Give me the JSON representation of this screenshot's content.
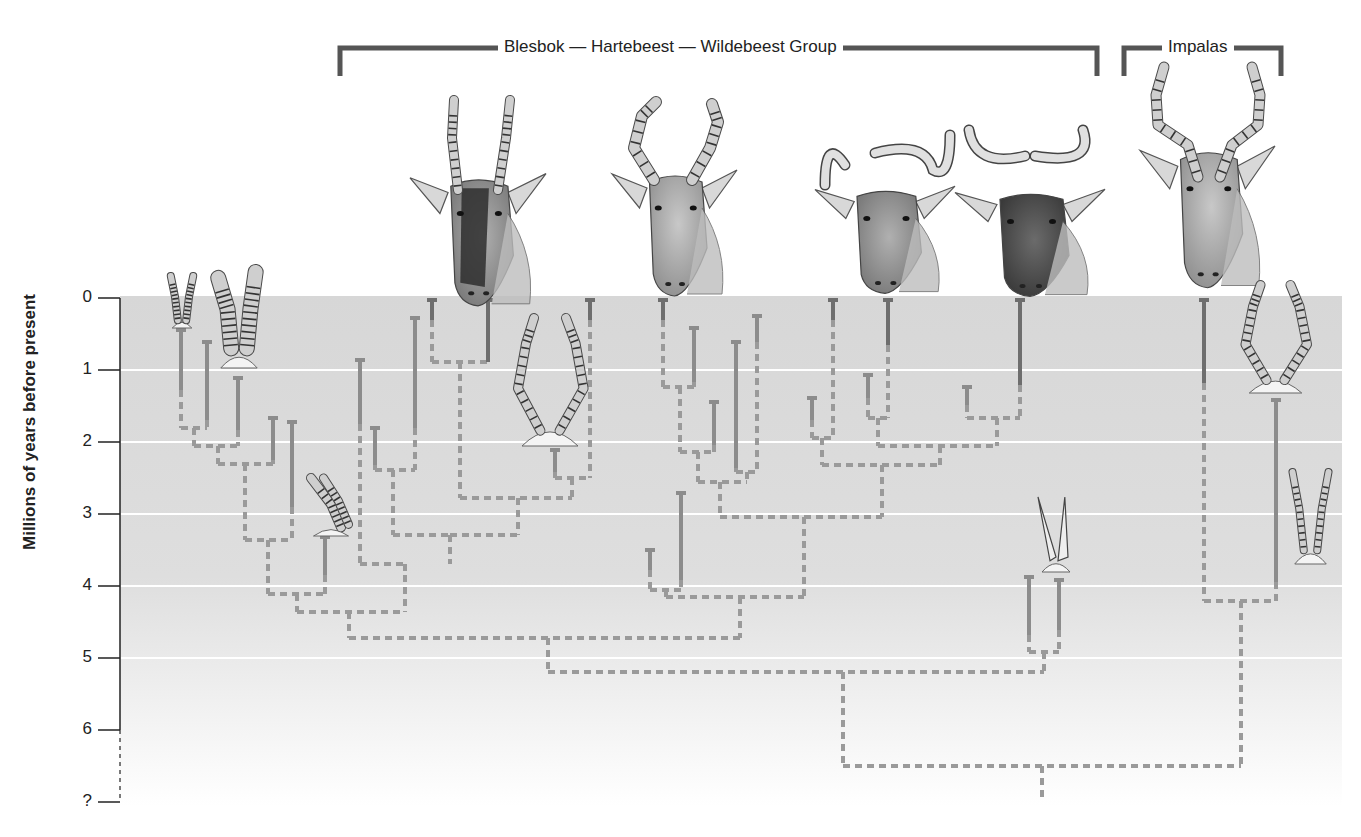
{
  "groups": [
    {
      "label": "Blesbok — Hartebeest — Wildebeest Group",
      "x1": 340,
      "x2": 1097,
      "y": 48,
      "text_x": 498
    },
    {
      "label": "Impalas",
      "x1": 1124,
      "x2": 1281,
      "y": 48,
      "text_x": 1162
    }
  ],
  "axis": {
    "title": "Millions of years before present",
    "ticks": [
      {
        "label": "0",
        "y": 298
      },
      {
        "label": "1",
        "y": 370
      },
      {
        "label": "2",
        "y": 442
      },
      {
        "label": "3",
        "y": 514
      },
      {
        "label": "4",
        "y": 586
      },
      {
        "label": "5",
        "y": 658
      },
      {
        "label": "6",
        "y": 730
      },
      {
        "label": "?",
        "y": 802
      }
    ]
  },
  "colors": {
    "panel_top": "#d6d6d6",
    "panel_bottom": "#ffffff",
    "gridline": "#ffffff",
    "solid_branch": "#8c8c8c",
    "solid_branch_dark": "#6e6e6e",
    "dashed_branch": "#9a9a9a",
    "bracket": "#555555",
    "axis": "#222222"
  },
  "chart_data": {
    "type": "phylogenetic_tree",
    "ylabel": "Millions of years before present",
    "ylim": [
      0,
      7
    ],
    "y_ticks": [
      "0",
      "1",
      "2",
      "3",
      "4",
      "5",
      "6",
      "?"
    ],
    "legend": {
      "solid": "fossil record (known range)",
      "dashed": "inferred lineage"
    },
    "clades": [
      {
        "name": "Blesbok — Hartebeest — Wildebeest Group",
        "living_taxa": [
          "Blesbok",
          "Hartebeest",
          "Black wildebeest",
          "Blue wildebeest"
        ]
      },
      {
        "name": "Impalas",
        "living_taxa": [
          "Impala"
        ]
      }
    ],
    "root_age_myr": 6.4,
    "key_splits_myr": [
      {
        "between": "Alcelaphine group vs Impalas",
        "age": 6.4
      },
      {
        "between": "Main alcelaphine radiation vs early side branch",
        "age": 5.15
      },
      {
        "between": "Blesbok/early lineages vs Hartebeest/Wildebeest",
        "age": 4.7
      },
      {
        "between": "Impala lineages",
        "age": 4.2
      },
      {
        "between": "Hartebeest vs Wildebeest lineages",
        "age": 3.0
      }
    ]
  },
  "tree": {
    "solid": [
      [
        181,
        330,
        181,
        390
      ],
      [
        207,
        342,
        207,
        420
      ],
      [
        238,
        378,
        238,
        430
      ],
      [
        273,
        418,
        273,
        460
      ],
      [
        292,
        422,
        292,
        507
      ],
      [
        325,
        537,
        325,
        575
      ],
      [
        360,
        360,
        360,
        424
      ],
      [
        375,
        428,
        375,
        465
      ],
      [
        415,
        318,
        415,
        428
      ],
      [
        432,
        300,
        432,
        320
      ],
      [
        488,
        300,
        488,
        362
      ],
      [
        555,
        450,
        555,
        472
      ],
      [
        590,
        300,
        590,
        320
      ],
      [
        663,
        300,
        663,
        320
      ],
      [
        694,
        328,
        694,
        382
      ],
      [
        714,
        402,
        714,
        445
      ],
      [
        736,
        342,
        736,
        468
      ],
      [
        757,
        316,
        757,
        342
      ],
      [
        681,
        493,
        681,
        580
      ],
      [
        650,
        550,
        650,
        570
      ],
      [
        833,
        300,
        833,
        320
      ],
      [
        888,
        300,
        888,
        345
      ],
      [
        868,
        375,
        868,
        398
      ],
      [
        812,
        398,
        812,
        420
      ],
      [
        967,
        387,
        967,
        405
      ],
      [
        1020,
        300,
        1020,
        385
      ],
      [
        1204,
        300,
        1204,
        383
      ],
      [
        1276,
        400,
        1276,
        582
      ],
      [
        1029,
        577,
        1029,
        635
      ],
      [
        1059,
        580,
        1059,
        630
      ]
    ],
    "dashed": [
      [
        181,
        390,
        181,
        428
      ],
      [
        181,
        428,
        207,
        428
      ],
      [
        207,
        420,
        207,
        428
      ],
      [
        194,
        428,
        194,
        446
      ],
      [
        194,
        446,
        238,
        446
      ],
      [
        238,
        430,
        238,
        446
      ],
      [
        218,
        446,
        218,
        464
      ],
      [
        218,
        464,
        273,
        464
      ],
      [
        273,
        460,
        273,
        464
      ],
      [
        245,
        464,
        245,
        540
      ],
      [
        245,
        540,
        292,
        540
      ],
      [
        292,
        507,
        292,
        540
      ],
      [
        268,
        540,
        268,
        594
      ],
      [
        268,
        594,
        325,
        594
      ],
      [
        325,
        575,
        325,
        594
      ],
      [
        297,
        594,
        297,
        612
      ],
      [
        297,
        612,
        405,
        612
      ],
      [
        405,
        575,
        405,
        612
      ],
      [
        360,
        424,
        360,
        564
      ],
      [
        360,
        564,
        405,
        564
      ],
      [
        405,
        564,
        405,
        575
      ],
      [
        375,
        465,
        375,
        470
      ],
      [
        375,
        470,
        415,
        470
      ],
      [
        415,
        428,
        415,
        470
      ],
      [
        393,
        470,
        393,
        535
      ],
      [
        393,
        535,
        450,
        535
      ],
      [
        450,
        535,
        450,
        564
      ],
      [
        432,
        320,
        432,
        362
      ],
      [
        432,
        362,
        488,
        362
      ],
      [
        460,
        362,
        460,
        498
      ],
      [
        460,
        498,
        572,
        498
      ],
      [
        555,
        472,
        555,
        478
      ],
      [
        555,
        478,
        590,
        478
      ],
      [
        590,
        320,
        590,
        478
      ],
      [
        572,
        478,
        572,
        498
      ],
      [
        518,
        498,
        518,
        535
      ],
      [
        450,
        535,
        518,
        535
      ],
      [
        349,
        612,
        349,
        638
      ],
      [
        349,
        638,
        740,
        638
      ],
      [
        663,
        320,
        663,
        387
      ],
      [
        663,
        387,
        694,
        387
      ],
      [
        694,
        382,
        694,
        387
      ],
      [
        680,
        387,
        680,
        452
      ],
      [
        680,
        452,
        714,
        452
      ],
      [
        714,
        445,
        714,
        452
      ],
      [
        698,
        452,
        698,
        482
      ],
      [
        698,
        482,
        747,
        482
      ],
      [
        736,
        468,
        736,
        472
      ],
      [
        736,
        472,
        757,
        472
      ],
      [
        757,
        342,
        757,
        472
      ],
      [
        747,
        472,
        747,
        482
      ],
      [
        720,
        482,
        720,
        517
      ],
      [
        720,
        517,
        882,
        517
      ],
      [
        650,
        570,
        650,
        590
      ],
      [
        650,
        590,
        681,
        590
      ],
      [
        681,
        580,
        681,
        590
      ],
      [
        666,
        590,
        666,
        597
      ],
      [
        666,
        597,
        804,
        597
      ],
      [
        804,
        517,
        804,
        597
      ],
      [
        740,
        597,
        740,
        638
      ],
      [
        812,
        420,
        812,
        438
      ],
      [
        812,
        438,
        833,
        438
      ],
      [
        833,
        320,
        833,
        438
      ],
      [
        822,
        438,
        822,
        465
      ],
      [
        822,
        465,
        940,
        465
      ],
      [
        868,
        398,
        868,
        418
      ],
      [
        868,
        418,
        888,
        418
      ],
      [
        888,
        345,
        888,
        418
      ],
      [
        878,
        418,
        878,
        446
      ],
      [
        878,
        446,
        997,
        446
      ],
      [
        940,
        446,
        940,
        465
      ],
      [
        882,
        465,
        882,
        517
      ],
      [
        967,
        405,
        967,
        418
      ],
      [
        967,
        418,
        1020,
        418
      ],
      [
        1020,
        385,
        1020,
        418
      ],
      [
        997,
        418,
        997,
        446
      ],
      [
        1029,
        635,
        1029,
        652
      ],
      [
        1029,
        652,
        1059,
        652
      ],
      [
        1059,
        630,
        1059,
        652
      ],
      [
        1044,
        652,
        1044,
        672
      ],
      [
        548,
        638,
        548,
        672
      ],
      [
        548,
        672,
        1044,
        672
      ],
      [
        843,
        672,
        843,
        766
      ],
      [
        1204,
        383,
        1204,
        601
      ],
      [
        1204,
        601,
        1276,
        601
      ],
      [
        1276,
        582,
        1276,
        601
      ],
      [
        1241,
        601,
        1241,
        766
      ],
      [
        843,
        766,
        1241,
        766
      ],
      [
        1042,
        766,
        1042,
        800
      ]
    ],
    "caps": [
      [
        181,
        330
      ],
      [
        207,
        342
      ],
      [
        238,
        378
      ],
      [
        273,
        418
      ],
      [
        292,
        422
      ],
      [
        325,
        537
      ],
      [
        360,
        360
      ],
      [
        375,
        428
      ],
      [
        415,
        318
      ],
      [
        432,
        300
      ],
      [
        488,
        300
      ],
      [
        555,
        450
      ],
      [
        590,
        300
      ],
      [
        663,
        300
      ],
      [
        694,
        328
      ],
      [
        714,
        402
      ],
      [
        736,
        342
      ],
      [
        757,
        316
      ],
      [
        681,
        493
      ],
      [
        650,
        550
      ],
      [
        833,
        300
      ],
      [
        888,
        300
      ],
      [
        868,
        375
      ],
      [
        812,
        398
      ],
      [
        967,
        387
      ],
      [
        1020,
        300
      ],
      [
        1204,
        300
      ],
      [
        1276,
        400
      ],
      [
        1029,
        577
      ],
      [
        1059,
        580
      ]
    ]
  },
  "illustrations": [
    {
      "name": "blesbok-head",
      "label": "Blesbok",
      "x": 410,
      "y": 98,
      "w": 136,
      "h": 210
    },
    {
      "name": "hartebeest-head",
      "label": "Hartebeest",
      "x": 612,
      "y": 98,
      "w": 125,
      "h": 200
    },
    {
      "name": "black-wildebeest-head",
      "label": "Black wildebeest",
      "x": 815,
      "y": 125,
      "w": 140,
      "h": 170
    },
    {
      "name": "blue-wildebeest-head",
      "label": "Blue wildebeest",
      "x": 955,
      "y": 128,
      "w": 150,
      "h": 170
    },
    {
      "name": "impala-head",
      "label": "Impala",
      "x": 1140,
      "y": 65,
      "w": 135,
      "h": 225
    }
  ],
  "fossil_horns": [
    {
      "name": "fossil-horns-1",
      "x": 168,
      "y": 276,
      "w": 28,
      "h": 52,
      "kind": "pair-ringed-slim"
    },
    {
      "name": "fossil-horns-2",
      "x": 213,
      "y": 270,
      "w": 52,
      "h": 98,
      "kind": "pair-ringed-large"
    },
    {
      "name": "fossil-horns-3",
      "x": 306,
      "y": 478,
      "w": 50,
      "h": 58,
      "kind": "pair-ringed-curved"
    },
    {
      "name": "fossil-horns-4",
      "x": 510,
      "y": 318,
      "w": 80,
      "h": 128,
      "kind": "lyre-ringed"
    },
    {
      "name": "fossil-horns-5",
      "x": 1036,
      "y": 497,
      "w": 40,
      "h": 75,
      "kind": "pair-smooth"
    },
    {
      "name": "fossil-horns-6",
      "x": 1238,
      "y": 285,
      "w": 75,
      "h": 108,
      "kind": "lyre-ringed"
    },
    {
      "name": "fossil-horns-7",
      "x": 1288,
      "y": 472,
      "w": 45,
      "h": 92,
      "kind": "pair-ringed-slim"
    }
  ]
}
